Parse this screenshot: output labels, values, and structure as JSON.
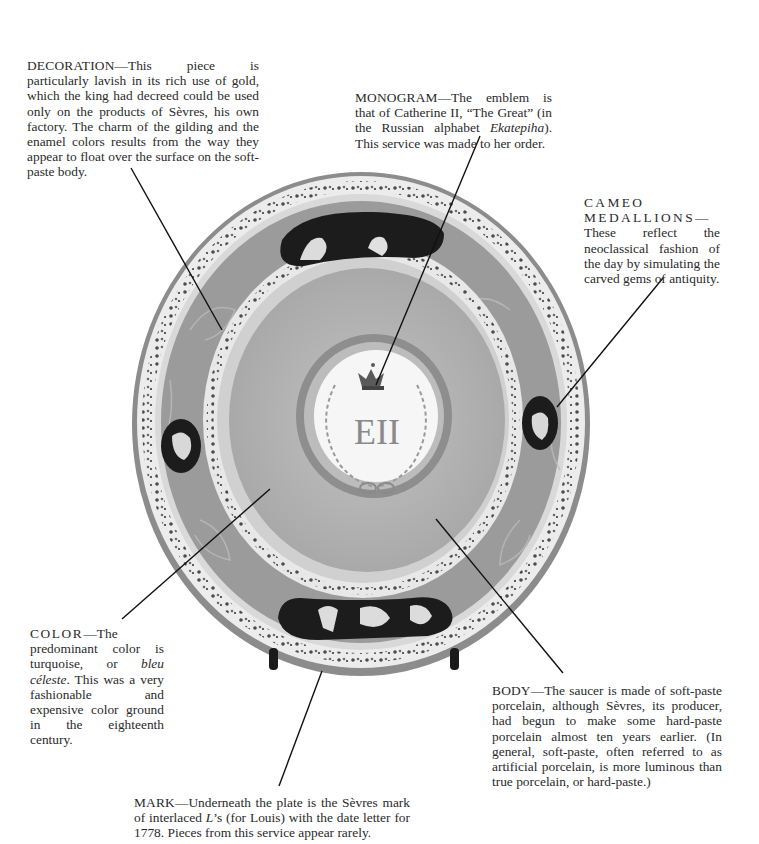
{
  "figure": {
    "colors": {
      "outer_rim": "#8c8c8c",
      "floral_band": "#e6e6e6",
      "scroll_band": "#9a9a9a",
      "bleu_celeste_ground": "#b4b4b4",
      "inner_ring": "#8e8e8e",
      "center_medallion": "#f6f6f6",
      "cameo_ground": "#1c1c1c",
      "stand": "#1a1a1a",
      "leader_line": "#111111"
    }
  },
  "captions": {
    "decoration": {
      "lead": "DECORATION",
      "text": "—This piece is particularly lavish in its rich use of gold, which the king had decreed could be used only on the products of Sèvres, his own factory. The charm of the gilding and the enamel colors results from the way they appear to float over the surface on the soft-paste body."
    },
    "monogram": {
      "lead": "MONOGRAM",
      "text_before": "—The emblem is that of Catherine II, “The Great” (in the Russian alphabet ",
      "italic": "Ekatepiha",
      "text_after": "). This service was made to her order."
    },
    "cameo": {
      "lead": "CAMEO MEDALLIONS",
      "text": "—These reflect the neoclassical fashion of the day by simulating the carved gems of antiquity."
    },
    "color": {
      "lead": "COLOR",
      "text_before": "—The predominant color is turquoise, or ",
      "italic": "bleu céleste",
      "text_after": ". This was a very fashionable and expensive color ground in the eighteenth century."
    },
    "body": {
      "lead": "BODY",
      "text": "—The saucer is made of soft-paste porcelain, although Sèvres, its producer, had begun to make some hard-paste porcelain almost ten years earlier. (In general, soft-paste, often referred to as artificial porcelain, is more luminous than true porcelain, or hard-paste.)"
    },
    "mark": {
      "lead": "MARK",
      "text_before": "—Underneath the plate is the Sèvres mark of interlaced ",
      "italic": "L",
      "text_after": "’s (for Louis) with the date letter for 1778. Pieces from this service appear rarely."
    }
  },
  "monogram_glyph": "ЕII"
}
